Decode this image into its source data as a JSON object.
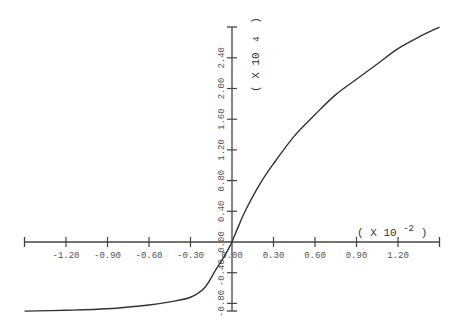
{
  "chart_data": {
    "type": "line",
    "title": "",
    "xlabel": "",
    "ylabel": "",
    "x_multiplier": "( X 10 -2)",
    "x_multiplier_base": "( X 10",
    "x_multiplier_exp": "-2",
    "x_multiplier_close": ")",
    "y_multiplier": "( X 10 4 )",
    "y_multiplier_base": "( X 10",
    "y_multiplier_exp": "4",
    "y_multiplier_close": ")",
    "xlim": [
      -1.5,
      1.5
    ],
    "ylim": [
      -0.92,
      2.8
    ],
    "grid": false,
    "legend": null,
    "x_ticks": [
      -1.2,
      -0.9,
      -0.6,
      -0.3,
      0.0,
      0.3,
      0.6,
      0.9,
      1.2
    ],
    "x_tick_labels": [
      "-1.20",
      "-0.90",
      "-0.60",
      "-0.30",
      "0.00",
      "0.30",
      "0.60",
      "0.90",
      "1.20"
    ],
    "y_ticks": [
      -0.8,
      -0.4,
      0.0,
      0.4,
      0.8,
      1.2,
      1.6,
      2.0,
      2.4
    ],
    "y_tick_labels": [
      "-0.80",
      "-0.40",
      "0.00",
      "0.40",
      "0.80",
      "1.20",
      "1.60",
      "2.00",
      "2.40"
    ],
    "series": [
      {
        "name": "curve",
        "color": "#333333",
        "x": [
          -1.5,
          -1.2,
          -0.9,
          -0.6,
          -0.45,
          -0.3,
          -0.2,
          -0.12,
          -0.06,
          -0.02,
          0.0,
          0.05,
          0.1,
          0.2,
          0.3,
          0.45,
          0.6,
          0.75,
          0.9,
          1.05,
          1.2,
          1.35,
          1.5
        ],
        "y": [
          -0.9,
          -0.89,
          -0.87,
          -0.82,
          -0.78,
          -0.72,
          -0.6,
          -0.37,
          -0.2,
          -0.07,
          0.0,
          0.22,
          0.42,
          0.75,
          1.02,
          1.38,
          1.66,
          1.92,
          2.12,
          2.32,
          2.52,
          2.67,
          2.8
        ]
      }
    ]
  }
}
